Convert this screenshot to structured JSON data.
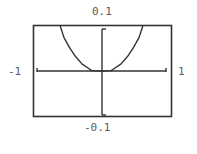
{
  "chart_data": {
    "type": "line",
    "title": "",
    "xlabel": "",
    "ylabel": "",
    "xlim": [
      -1,
      1
    ],
    "ylim": [
      -0.1,
      0.1
    ],
    "tick_labels": {
      "x_min": "-1",
      "x_max": "1",
      "y_min": "-0.1",
      "y_max": "0.1"
    },
    "grid": false,
    "legend": null,
    "series": [
      {
        "name": "f(x)",
        "x": [
          -0.64,
          -0.58,
          -0.49,
          -0.4,
          -0.3,
          -0.21,
          -0.15,
          0.0,
          0.15,
          0.21,
          0.3,
          0.4,
          0.49,
          0.58,
          0.64
        ],
        "y": [
          0.105,
          0.077,
          0.053,
          0.033,
          0.016,
          0.007,
          0.001,
          0.0,
          0.001,
          0.007,
          0.016,
          0.033,
          0.053,
          0.077,
          0.105
        ]
      }
    ]
  },
  "labels": {
    "y_max": "0.1",
    "y_min": "-0.1",
    "x_min": "-1",
    "x_max": "1"
  },
  "colors": {
    "frame": "#333333",
    "axes": "#333333",
    "curve": "#333333",
    "text": "#5a5a5a"
  }
}
